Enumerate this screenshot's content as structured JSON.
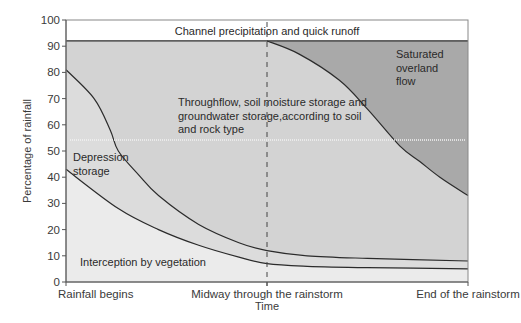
{
  "chart_data": {
    "type": "area",
    "title": "",
    "xlabel": "Time",
    "ylabel": "Percentage of rainfall",
    "ylim": [
      0,
      100
    ],
    "yticks": [
      0,
      10,
      20,
      30,
      40,
      50,
      60,
      70,
      80,
      90,
      100
    ],
    "xticks": [
      {
        "pos": 0,
        "label": "Rainfall begins"
      },
      {
        "pos": 50,
        "label": "Midway through the rainstorm"
      },
      {
        "pos": 100,
        "label": "End of the rainstorm"
      }
    ],
    "grid": false,
    "midway_marker": {
      "x": 50,
      "style": "dashed"
    },
    "series": [
      {
        "name": "Channel precipitation and quick runoff",
        "boundary": "upper band 92-100",
        "points": [
          [
            0,
            92
          ],
          [
            100,
            92
          ]
        ]
      },
      {
        "name": "Saturated overland flow",
        "boundary": "curve from midway to end (below 92 line)",
        "points": [
          [
            50,
            92
          ],
          [
            58,
            87
          ],
          [
            68,
            77
          ],
          [
            75,
            66
          ],
          [
            83,
            52
          ],
          [
            88,
            46
          ],
          [
            93,
            40
          ],
          [
            100,
            33
          ]
        ]
      },
      {
        "name": "Depression storage",
        "boundary": "upper curve",
        "points": [
          [
            0,
            81
          ],
          [
            7,
            70
          ],
          [
            11,
            58
          ],
          [
            13,
            50
          ],
          [
            18,
            41
          ],
          [
            23,
            33
          ],
          [
            33,
            22
          ],
          [
            43,
            15
          ],
          [
            50,
            12
          ],
          [
            60,
            10
          ],
          [
            75,
            9
          ],
          [
            100,
            8
          ]
        ]
      },
      {
        "name": "Interception by vegetation",
        "boundary": "lower curve",
        "points": [
          [
            0,
            43
          ],
          [
            13,
            28
          ],
          [
            23,
            20
          ],
          [
            33,
            14
          ],
          [
            43,
            9.5
          ],
          [
            50,
            7
          ],
          [
            60,
            6
          ],
          [
            75,
            5.5
          ],
          [
            100,
            5
          ]
        ]
      }
    ],
    "region_labels": {
      "channel": "Channel precipitation and quick runoff",
      "saturated": [
        "Saturated",
        "overland",
        "flow"
      ],
      "throughflow": [
        "Throughflow, soil moisture storage and",
        "groundwater storage,according to soil",
        "and rock type"
      ],
      "depression": [
        "Depression",
        "storage"
      ],
      "interception": "Interception by vegetation"
    },
    "colors": {
      "channel": "#ffffff",
      "saturated": "#a9a9a9",
      "throughflow": "#d3d3d3",
      "depression": "#dcdcdc",
      "interception": "#ebebeb",
      "band_low": "#e2e2e2",
      "line": "#2b2b2b",
      "axis": "#555555"
    }
  }
}
